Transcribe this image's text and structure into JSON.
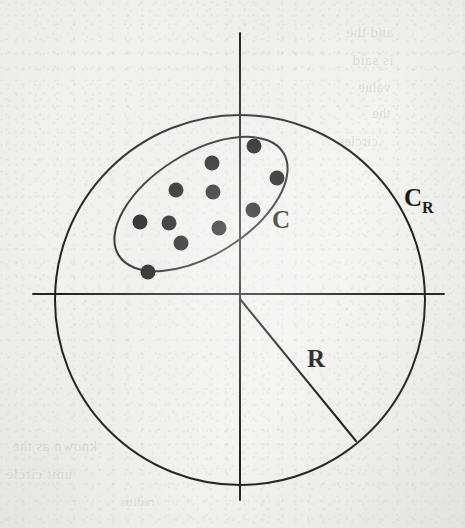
{
  "figure": {
    "kind": "geometry-diagram",
    "background_color": "#f1f1f0",
    "ink_color": "#221f20",
    "dot_color": "#141314"
  },
  "labels": {
    "ellipse_label": "C",
    "circle_label_base": "C",
    "circle_label_sub": "R",
    "radius_label": "R"
  },
  "axes": {
    "horizontal": {
      "y": 294,
      "x1": 33,
      "x2": 444
    },
    "vertical": {
      "x": 240,
      "y1": 33,
      "y2": 500
    },
    "origin": {
      "x": 240,
      "y": 296
    }
  },
  "circle": {
    "name": "C_R",
    "cx": 240,
    "cy": 300,
    "r": 185,
    "stroke_width": 2
  },
  "ellipse": {
    "name": "C",
    "cx": 201,
    "cy": 204,
    "rx": 97,
    "ry": 51,
    "rotation_deg": -32,
    "stroke_width": 2
  },
  "radius_line": {
    "x1": 240,
    "y1": 299,
    "x2": 356,
    "y2": 441,
    "stroke_width": 2
  },
  "label_positions": {
    "ellipse_label": {
      "x": 272,
      "y": 228
    },
    "circle_label": {
      "x": 404,
      "y": 206
    },
    "radius_label": {
      "x": 307,
      "y": 367
    }
  },
  "points": {
    "count": 11,
    "radius": 7.5,
    "items": [
      {
        "id": "p1",
        "x": 254,
        "y": 146
      },
      {
        "id": "p2",
        "x": 212,
        "y": 163
      },
      {
        "id": "p3",
        "x": 277,
        "y": 178
      },
      {
        "id": "p4",
        "x": 176,
        "y": 190
      },
      {
        "id": "p5",
        "x": 213,
        "y": 192
      },
      {
        "id": "p6",
        "x": 253,
        "y": 210
      },
      {
        "id": "p7",
        "x": 140,
        "y": 222
      },
      {
        "id": "p8",
        "x": 169,
        "y": 223
      },
      {
        "id": "p9",
        "x": 219,
        "y": 228
      },
      {
        "id": "p10",
        "x": 181,
        "y": 243
      },
      {
        "id": "p11",
        "x": 148,
        "y": 272
      }
    ]
  },
  "bleed_through": [
    {
      "id": "b1",
      "text": "and the",
      "x": 346,
      "y": 24,
      "size": 15
    },
    {
      "id": "b2",
      "text": "is said",
      "x": 352,
      "y": 52,
      "size": 15
    },
    {
      "id": "b3",
      "text": "value",
      "x": 358,
      "y": 80,
      "size": 14
    },
    {
      "id": "b4",
      "text": "the",
      "x": 372,
      "y": 106,
      "size": 14
    },
    {
      "id": "b5",
      "text": "circles",
      "x": 338,
      "y": 134,
      "size": 14
    },
    {
      "id": "b6",
      "text": "known as the",
      "x": 12,
      "y": 438,
      "size": 15
    },
    {
      "id": "b7",
      "text": "unit circle",
      "x": 6,
      "y": 466,
      "size": 15
    },
    {
      "id": "b8",
      "text": "radius",
      "x": 120,
      "y": 494,
      "size": 13
    }
  ]
}
